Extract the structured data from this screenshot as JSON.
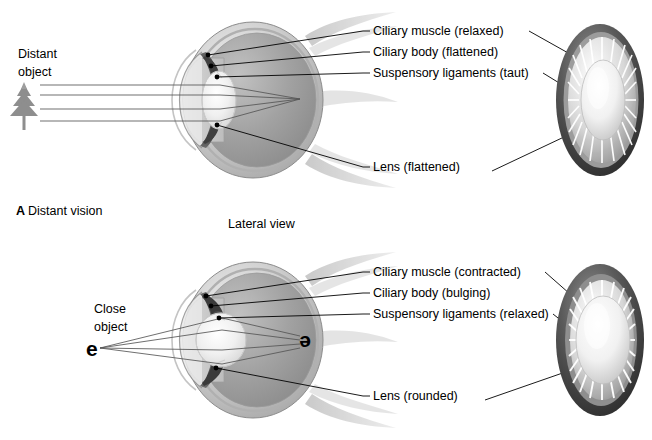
{
  "figure": {
    "view_caption": "Lateral view",
    "background_color": "#ffffff"
  },
  "panels": [
    {
      "id": "panel-a",
      "letter": "A",
      "caption": "Distant vision",
      "object_label_line1": "Distant",
      "object_label_line2": "object",
      "object_icon": "pine-tree-icon",
      "image_glyph": "",
      "labels": [
        {
          "id": "ciliary-muscle",
          "text": "Ciliary muscle (relaxed)"
        },
        {
          "id": "ciliary-body",
          "text": "Ciliary body (flattened)"
        },
        {
          "id": "suspensory-ligaments",
          "text": "Suspensory ligaments (taut)"
        },
        {
          "id": "lens",
          "text": "Lens (flattened)"
        }
      ]
    },
    {
      "id": "panel-b",
      "letter": "",
      "caption": "",
      "object_label_line1": "Close",
      "object_label_line2": "object",
      "object_icon": "letter-e-glyph",
      "image_glyph": "e",
      "labels": [
        {
          "id": "ciliary-muscle",
          "text": "Ciliary muscle (contracted)"
        },
        {
          "id": "ciliary-body",
          "text": "Ciliary body (bulging)"
        },
        {
          "id": "suspensory-ligaments",
          "text": "Suspensory ligaments (relaxed)"
        },
        {
          "id": "lens",
          "text": "Lens (rounded)"
        }
      ]
    }
  ],
  "colors": {
    "ink": "#000000",
    "ray": "#555555",
    "sclera_light": "#e6e6e6",
    "sclera_mid": "#bdbdbd",
    "vitreous": "#9a9a9a",
    "lens_light": "#f2f2f2",
    "ciliary_dark": "#4a4a4a",
    "ring_dark": "#3a3a3a",
    "ring_mid": "#7a7a7a"
  }
}
